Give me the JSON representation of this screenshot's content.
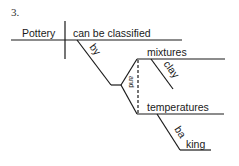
{
  "problem_number": "3.",
  "diagram": {
    "subject": "Pottery",
    "verb": "can be classified",
    "preposition": "by",
    "conjunction": "and",
    "objects": [
      {
        "word": "mixtures",
        "modifier": "clay"
      },
      {
        "word": "temperatures",
        "modifier": "baking"
      }
    ]
  },
  "colors": {
    "line": "#1a1a1a",
    "text": "#1a1a1a",
    "number": "#333333",
    "background": "#ffffff"
  }
}
